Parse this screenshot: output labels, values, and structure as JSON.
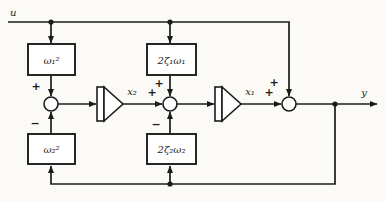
{
  "colors": {
    "ink": "#1c1c1c",
    "paper": "#fbfaf6"
  },
  "signals": {
    "input": "u",
    "state2": "x₂",
    "state1": "x₁",
    "output": "y"
  },
  "blocks": {
    "omega1_sq": "ω₁²",
    "two_zeta1_omega1": "2ζ₁ω₁",
    "omega2_sq": "ω₂²",
    "two_zeta2_omega2": "2ζ₂ω₂"
  },
  "signs": {
    "sum1_top": "+",
    "sum1_bottom": "−",
    "sum2_left": "+",
    "sum2_top": "+",
    "sum2_bottom": "−",
    "sum3_left": "+",
    "sum3_top": "+"
  }
}
